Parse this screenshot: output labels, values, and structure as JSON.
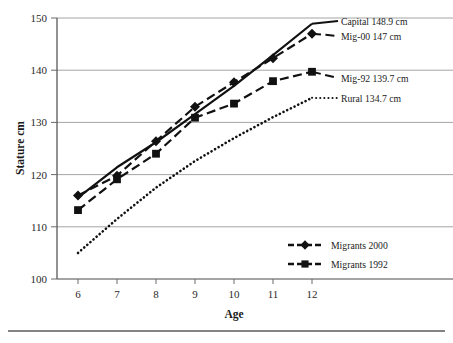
{
  "chart_data": {
    "type": "line",
    "title": "",
    "xlabel": "Age",
    "ylabel": "Stature cm",
    "x": [
      6,
      7,
      8,
      9,
      10,
      11,
      12
    ],
    "categories": [
      "6",
      "7",
      "8",
      "9",
      "10",
      "11",
      "12"
    ],
    "xlim": [
      6,
      12
    ],
    "ylim": [
      100,
      150
    ],
    "yticks": [
      100,
      110,
      120,
      130,
      140,
      150
    ],
    "ytick_labels": [
      "100",
      "110",
      "120",
      "130",
      "140",
      "150"
    ],
    "xtick_labels": [
      "6",
      "7",
      "8",
      "9",
      "10",
      "11",
      "12"
    ],
    "grid": "horizontal",
    "legend_position": "inside-bottom-right",
    "series": [
      {
        "name": "Capital",
        "style": "solid",
        "marker": "none",
        "values": [
          115.6,
          121.4,
          126.2,
          131.6,
          137.0,
          142.9,
          148.9
        ],
        "end_label": "Capital 148.9 cm"
      },
      {
        "name": "Migrants 2000",
        "style": "dashed",
        "marker": "diamond",
        "values": [
          116.0,
          119.8,
          126.4,
          133.0,
          137.7,
          142.3,
          147.0
        ],
        "end_label": "Mig-00 147 cm"
      },
      {
        "name": "Migrants 1992",
        "style": "dashed",
        "marker": "square",
        "values": [
          113.2,
          119.1,
          124.0,
          130.9,
          133.6,
          137.9,
          139.7
        ],
        "end_label": "Mig-92 139.7 cm"
      },
      {
        "name": "Rural",
        "style": "dotted",
        "marker": "none",
        "values": [
          105.0,
          111.5,
          117.5,
          122.6,
          127.0,
          131.0,
          134.7
        ],
        "end_label": "Rural 134.7 cm"
      }
    ],
    "annotations": [
      "Capital 148.9 cm",
      "Mig-00 147 cm",
      "Mig-92 139.7 cm",
      "Rural 134.7 cm"
    ],
    "legend_entries": [
      {
        "label": "Migrants 2000",
        "marker": "diamond",
        "style": "dashed"
      },
      {
        "label": "Migrants 1992",
        "marker": "square",
        "style": "dashed"
      }
    ],
    "colors": {
      "line": "#111111",
      "grid": "#9a9a9a",
      "axis": "#4a4a4a",
      "text": "#1a1a1a",
      "background": "#ffffff"
    }
  },
  "axes": {
    "y_title": "Stature cm",
    "x_title": "Age",
    "y_labels": [
      "150",
      "140",
      "130",
      "120",
      "110",
      "100"
    ],
    "x_labels": [
      "6",
      "7",
      "8",
      "9",
      "10",
      "11",
      "12"
    ]
  },
  "annotations": {
    "capital": "Capital 148.9 cm",
    "mig00": "Mig-00 147 cm",
    "mig92": "Mig-92 139.7 cm",
    "rural": "Rural 134.7 cm"
  },
  "legend": {
    "items": [
      {
        "label": "Migrants 2000"
      },
      {
        "label": "Migrants 1992"
      }
    ]
  }
}
